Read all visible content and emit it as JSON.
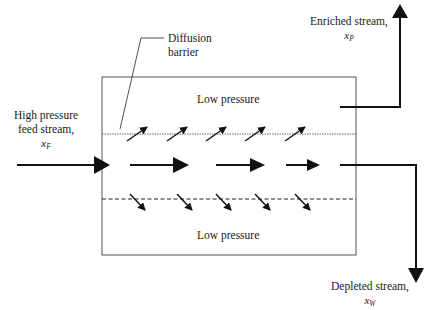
{
  "diagram": {
    "type": "gaseous diffusion separation stage",
    "labels": {
      "feed": {
        "line1": "High pressure",
        "line2": "feed stream,",
        "symbol": "x",
        "subscript": "F"
      },
      "barrier": {
        "line1": "Diffusion",
        "line2": "barrier"
      },
      "low_pressure_top": "Low pressure",
      "low_pressure_bottom": "Low pressure",
      "enriched": {
        "line1": "Enriched stream,",
        "symbol": "x",
        "subscript": "P"
      },
      "depleted": {
        "line1": "Depleted stream,",
        "symbol": "x",
        "subscript": "W"
      }
    },
    "colors": {
      "line": "#111111",
      "box": "#555555",
      "background": "#ffffff"
    }
  }
}
